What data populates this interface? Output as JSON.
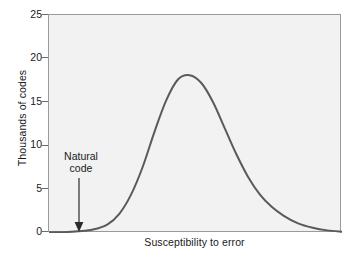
{
  "chart_data": {
    "type": "line",
    "title": "",
    "xlabel": "Susceptibility to error",
    "ylabel": "Thousands of codes",
    "ylim": [
      0,
      25
    ],
    "yticks": [
      0,
      5,
      10,
      15,
      20,
      25
    ],
    "ytick_labels": [
      "0",
      "5",
      "10",
      "15",
      "20",
      "25"
    ],
    "xticks": [],
    "xtick_labels": [],
    "grid": false,
    "legend": null,
    "series": [
      {
        "name": "Distribution of codes",
        "color": "#5a5a5a",
        "x": [
          0.0,
          0.05,
          0.1,
          0.15,
          0.2,
          0.24,
          0.28,
          0.32,
          0.36,
          0.4,
          0.44,
          0.48,
          0.52,
          0.56,
          0.6,
          0.64,
          0.68,
          0.72,
          0.76,
          0.8,
          0.85,
          0.9,
          0.95,
          1.0
        ],
        "y": [
          0.1,
          0.1,
          0.2,
          0.4,
          1.0,
          2.2,
          4.4,
          7.6,
          11.6,
          15.2,
          17.6,
          18.1,
          17.2,
          15.0,
          12.0,
          9.0,
          6.4,
          4.4,
          3.0,
          2.0,
          1.1,
          0.6,
          0.3,
          0.15
        ],
        "peak_value": 18.1,
        "peak_x": 0.48
      }
    ],
    "annotations": [
      {
        "name": "natural-code",
        "lines": [
          "Natural",
          "code"
        ],
        "arrow": "down",
        "x": 0.105,
        "y": 0.0
      }
    ]
  }
}
